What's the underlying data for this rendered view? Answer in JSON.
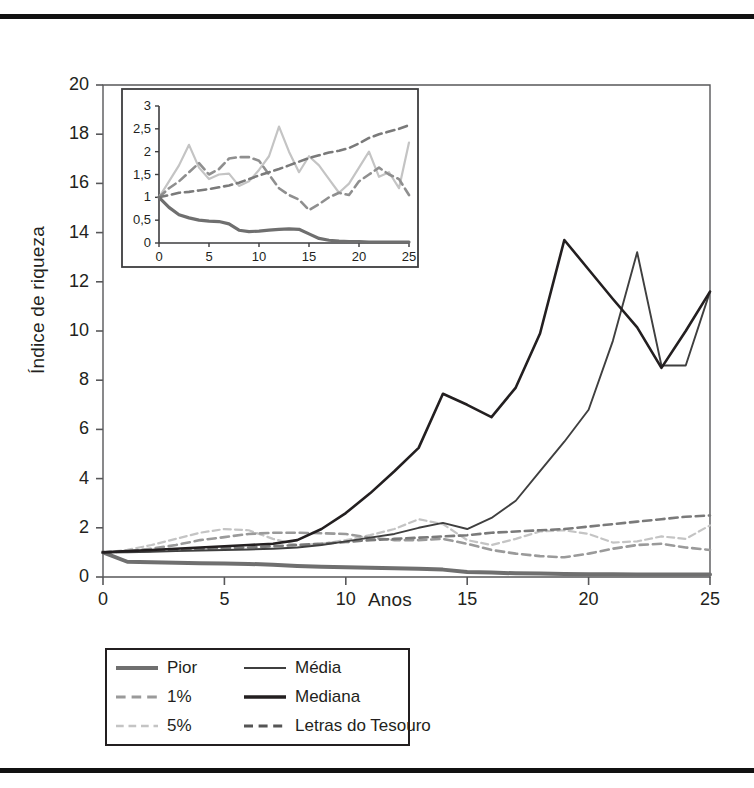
{
  "chart_data": {
    "type": "line",
    "title": "",
    "xlabel": "Anos",
    "ylabel": "Índice de riqueza",
    "xlim": [
      0,
      25
    ],
    "ylim": [
      0,
      20
    ],
    "xticks": [
      "0",
      "5",
      "10",
      "15",
      "20",
      "25"
    ],
    "yticks": [
      "0",
      "2",
      "4",
      "6",
      "8",
      "10",
      "12",
      "14",
      "16",
      "18",
      "20"
    ],
    "grid": false,
    "legend_position": "below-left",
    "x": [
      0,
      1,
      2,
      3,
      4,
      5,
      6,
      7,
      8,
      9,
      10,
      11,
      12,
      13,
      14,
      15,
      16,
      17,
      18,
      19,
      20,
      21,
      22,
      23,
      24,
      25
    ],
    "series": [
      {
        "name": "Mediana",
        "style": "solid",
        "width": 2.6,
        "color": "#231f20",
        "values": [
          1.0,
          1.05,
          1.1,
          1.15,
          1.2,
          1.25,
          1.3,
          1.35,
          1.5,
          1.95,
          2.6,
          3.4,
          4.3,
          5.25,
          7.45,
          7.0,
          6.5,
          7.7,
          9.9,
          13.7,
          12.5,
          11.3,
          10.15,
          8.5,
          10.0,
          11.6
        ]
      },
      {
        "name": "Média",
        "style": "solid",
        "width": 1.9,
        "color": "#3f3f3f",
        "values": [
          1.0,
          1.0,
          1.02,
          1.05,
          1.08,
          1.1,
          1.12,
          1.15,
          1.2,
          1.3,
          1.45,
          1.6,
          1.75,
          2.0,
          2.2,
          1.95,
          2.4,
          3.1,
          4.3,
          5.5,
          6.8,
          9.6,
          13.2,
          8.6,
          8.6,
          11.6
        ]
      },
      {
        "name": "Letras do Tesouro",
        "style": "dashed",
        "width": 2.6,
        "color": "#7a7a7a",
        "values": [
          1.0,
          1.03,
          1.06,
          1.1,
          1.14,
          1.18,
          1.2,
          1.25,
          1.3,
          1.35,
          1.42,
          1.5,
          1.55,
          1.6,
          1.65,
          1.7,
          1.8,
          1.85,
          1.9,
          1.95,
          2.05,
          2.15,
          2.25,
          2.35,
          2.45,
          2.5
        ]
      },
      {
        "name": "1%",
        "style": "dashed",
        "width": 2.6,
        "color": "#9a9a9a",
        "values": [
          1.0,
          1.05,
          1.15,
          1.3,
          1.5,
          1.62,
          1.75,
          1.8,
          1.8,
          1.78,
          1.75,
          1.6,
          1.5,
          1.5,
          1.55,
          1.35,
          1.1,
          0.95,
          0.85,
          0.8,
          0.95,
          1.15,
          1.3,
          1.35,
          1.2,
          1.1
        ]
      },
      {
        "name": "5%",
        "style": "dashed",
        "width": 2.2,
        "color": "#c4c4c4",
        "values": [
          1.0,
          1.1,
          1.3,
          1.55,
          1.8,
          1.95,
          1.9,
          1.55,
          1.3,
          1.35,
          1.5,
          1.7,
          1.95,
          2.35,
          2.15,
          1.5,
          1.3,
          1.55,
          1.85,
          1.9,
          1.75,
          1.4,
          1.45,
          1.65,
          1.55,
          2.1
        ]
      },
      {
        "name": "Pior",
        "style": "solid",
        "width": 4.0,
        "color": "#6f6f6f",
        "values": [
          1.0,
          0.62,
          0.6,
          0.58,
          0.56,
          0.55,
          0.53,
          0.5,
          0.45,
          0.42,
          0.4,
          0.38,
          0.36,
          0.34,
          0.3,
          0.2,
          0.18,
          0.15,
          0.14,
          0.12,
          0.11,
          0.11,
          0.1,
          0.1,
          0.1,
          0.1
        ]
      }
    ],
    "inset": {
      "type": "line",
      "xlim": [
        0,
        25
      ],
      "ylim": [
        0,
        3
      ],
      "xticks": [
        "0",
        "5",
        "10",
        "15",
        "20",
        "25"
      ],
      "yticks": [
        "0",
        "0,5",
        "1",
        "1,5",
        "2",
        "2,5",
        "3"
      ],
      "x": [
        0,
        1,
        2,
        3,
        4,
        5,
        6,
        7,
        8,
        9,
        10,
        11,
        12,
        13,
        14,
        15,
        16,
        17,
        18,
        19,
        20,
        21,
        22,
        23,
        24,
        25
      ],
      "series": [
        {
          "name": "Pior",
          "style": "solid",
          "width": 3.2,
          "color": "#6f6f6f",
          "values": [
            1.0,
            0.78,
            0.62,
            0.55,
            0.5,
            0.48,
            0.47,
            0.42,
            0.28,
            0.25,
            0.26,
            0.28,
            0.3,
            0.31,
            0.3,
            0.2,
            0.1,
            0.06,
            0.04,
            0.03,
            0.03,
            0.02,
            0.02,
            0.02,
            0.02,
            0.02
          ]
        },
        {
          "name": "Letras do Tesouro",
          "style": "dashed",
          "width": 2.6,
          "color": "#7a7a7a",
          "values": [
            1.0,
            1.05,
            1.1,
            1.12,
            1.15,
            1.18,
            1.22,
            1.26,
            1.32,
            1.4,
            1.48,
            1.55,
            1.62,
            1.7,
            1.78,
            1.86,
            1.92,
            1.98,
            2.02,
            2.08,
            2.18,
            2.3,
            2.38,
            2.44,
            2.5,
            2.58
          ]
        },
        {
          "name": "1%",
          "style": "dashed",
          "width": 2.6,
          "color": "#8f8f8f",
          "values": [
            1.0,
            1.2,
            1.35,
            1.55,
            1.75,
            1.5,
            1.62,
            1.85,
            1.88,
            1.88,
            1.8,
            1.5,
            1.2,
            1.05,
            0.95,
            0.72,
            0.85,
            1.0,
            1.1,
            1.05,
            1.35,
            1.5,
            1.65,
            1.5,
            1.4,
            1.05
          ]
        },
        {
          "name": "5%",
          "style": "solid",
          "width": 2.2,
          "color": "#c4c4c4",
          "values": [
            1.0,
            1.35,
            1.7,
            2.15,
            1.65,
            1.4,
            1.5,
            1.52,
            1.25,
            1.35,
            1.6,
            1.9,
            2.55,
            2.0,
            1.55,
            1.9,
            1.7,
            1.4,
            1.1,
            1.3,
            1.65,
            2.0,
            1.45,
            1.55,
            1.2,
            2.2
          ]
        }
      ]
    },
    "legend": {
      "left_column": [
        {
          "label": "Pior",
          "style": "solid",
          "width": 4.0,
          "color": "#6f6f6f"
        },
        {
          "label": "1%",
          "style": "dashed",
          "width": 3.0,
          "color": "#9a9a9a"
        },
        {
          "label": "5%",
          "style": "dashed",
          "width": 2.4,
          "color": "#c4c4c4"
        }
      ],
      "right_column": [
        {
          "label": "Média",
          "style": "solid",
          "width": 2.0,
          "color": "#3f3f3f"
        },
        {
          "label": "Mediana",
          "style": "solid",
          "width": 3.4,
          "color": "#231f20"
        },
        {
          "label": "Letras do Tesouro",
          "style": "dashed",
          "width": 2.8,
          "color": "#555555"
        }
      ]
    }
  }
}
